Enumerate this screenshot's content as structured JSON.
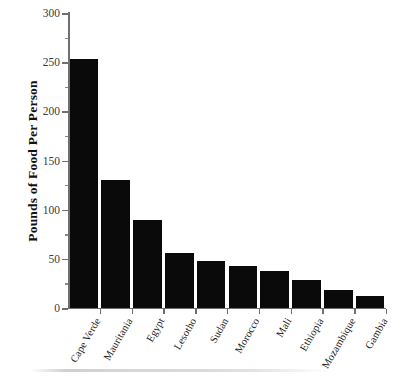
{
  "chart_data": {
    "type": "bar",
    "title": "",
    "xlabel": "",
    "ylabel": "Pounds of Food Per Person",
    "ylim": [
      0,
      300
    ],
    "ytick_major": [
      0,
      50,
      100,
      150,
      200,
      250,
      300
    ],
    "ytick_minor": [
      25,
      75,
      125,
      175,
      225,
      275
    ],
    "ytick_labels": [
      "0",
      "50",
      "100",
      "150",
      "200",
      "250",
      "300"
    ],
    "grid": false,
    "legend": null,
    "bar_color": "#0a0a0a",
    "axis_color": "#6f6f6f",
    "categories": [
      "Cape Verde",
      "Mauritania",
      "Egypt",
      "Lesotho",
      "Sudan",
      "Morocco",
      "Mali",
      "Ethiopia",
      "Mozambique",
      "Gambia"
    ],
    "values": [
      253,
      130,
      89,
      56,
      48,
      43,
      38,
      28,
      18,
      12
    ]
  }
}
